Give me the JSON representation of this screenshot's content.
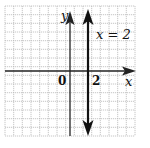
{
  "graph": {
    "title": "",
    "x_axis_label": "x",
    "y_axis_label": "y",
    "origin_label": "0",
    "x_tick_label": "2",
    "line_label": "x = 2",
    "line_equation": "x = 2",
    "grid": {
      "x_min": -8,
      "x_max": 7,
      "y_min": -7,
      "y_max": 8,
      "step": 1
    },
    "colors": {
      "grid": "#b0b0b0",
      "axis": "#222222",
      "line": "#111111"
    }
  }
}
